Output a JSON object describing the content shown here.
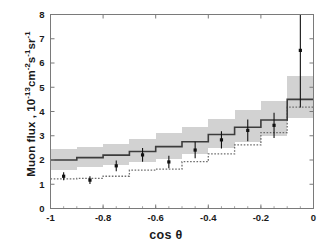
{
  "figure": {
    "background_color": "#ffffff",
    "frame_color": "#7a7a7a"
  },
  "axis_labels": {
    "x_label_prefix": "cos ",
    "x_label_symbol": "θ",
    "y_label_main": "Muon flux , 10",
    "y_label_exp1": "-13",
    "y_label_mid1": "cm",
    "y_label_exp2": "-2",
    "y_label_mid2": "s",
    "y_label_exp3": "-1",
    "y_label_mid3": "sr",
    "y_label_exp4": "-1"
  },
  "chart_data": {
    "type": "line",
    "title": "",
    "xlabel": "cos θ",
    "ylabel": "Muon flux , 10^-13 cm^-2 s^-1 sr^-1",
    "xlim": [
      -1,
      0
    ],
    "ylim": [
      0,
      8
    ],
    "grid": false,
    "legend_position": "none",
    "xticks": [
      -1,
      -0.8,
      -0.6,
      -0.4,
      -0.2,
      0
    ],
    "xtick_labels": [
      "-1",
      "-0.8",
      "-0.6",
      "-0.4",
      "-0.2",
      "0"
    ],
    "yticks": [
      0,
      1,
      2,
      3,
      4,
      5,
      6,
      7,
      8
    ],
    "ytick_labels": [
      "0",
      "1",
      "2",
      "3",
      "4",
      "5",
      "6",
      "7",
      "8"
    ],
    "bin_edges": [
      -1.0,
      -0.9,
      -0.8,
      -0.7,
      -0.6,
      -0.5,
      -0.4,
      -0.3,
      -0.2,
      -0.1,
      0.0
    ],
    "series": [
      {
        "name": "model-central-solid",
        "style": "step-solid",
        "color": "#3c3c3c",
        "values": [
          2.0,
          2.1,
          2.2,
          2.35,
          2.55,
          2.75,
          3.05,
          3.35,
          3.65,
          4.5
        ]
      },
      {
        "name": "model-band-upper",
        "style": "step-band",
        "color": "#d2d2d2",
        "values": [
          2.45,
          2.55,
          2.65,
          2.85,
          3.1,
          3.35,
          3.7,
          4.05,
          4.45,
          5.45
        ]
      },
      {
        "name": "model-band-lower",
        "style": "step-band",
        "color": "#d2d2d2",
        "values": [
          1.58,
          1.7,
          1.8,
          1.9,
          2.05,
          2.25,
          2.5,
          2.75,
          3.0,
          3.75
        ]
      },
      {
        "name": "model-alternative-dotted",
        "style": "step-dotted",
        "color": "#6e6e6e",
        "values": [
          1.22,
          1.24,
          1.33,
          1.58,
          1.62,
          1.93,
          2.25,
          2.62,
          3.13,
          4.18
        ]
      }
    ],
    "data_points": {
      "name": "measured-muon-flux",
      "marker": "square",
      "color": "#111111",
      "x": [
        -0.95,
        -0.85,
        -0.75,
        -0.65,
        -0.55,
        -0.45,
        -0.35,
        -0.25,
        -0.15,
        -0.05
      ],
      "y": [
        1.33,
        1.17,
        1.76,
        2.21,
        1.92,
        2.41,
        2.83,
        3.22,
        3.43,
        6.52
      ],
      "yerr_low": [
        0.16,
        0.16,
        0.22,
        0.28,
        0.26,
        0.34,
        0.36,
        0.45,
        0.52,
        2.35
      ],
      "yerr_high": [
        0.16,
        0.16,
        0.22,
        0.28,
        0.26,
        0.34,
        0.36,
        0.45,
        0.52,
        2.35
      ]
    }
  }
}
